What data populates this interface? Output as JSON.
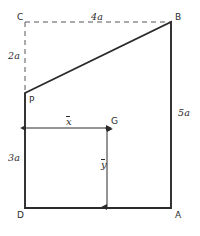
{
  "figure": {
    "stroke_color": "#2b2b2b",
    "background_color": "#ffffff",
    "vertices": [
      {
        "id": "C",
        "label": "C",
        "x": 25,
        "y": 22,
        "kind": "construction-corner"
      },
      {
        "id": "B",
        "label": "B",
        "x": 171,
        "y": 22,
        "kind": "shape-corner"
      },
      {
        "id": "P",
        "label": "P",
        "x": 25,
        "y": 93,
        "kind": "shape-corner"
      },
      {
        "id": "G",
        "label": "G",
        "x": 107,
        "y": 128,
        "kind": "centroid-point"
      },
      {
        "id": "D",
        "label": "D",
        "x": 25,
        "y": 208,
        "kind": "shape-corner"
      },
      {
        "id": "A",
        "label": "A",
        "x": 171,
        "y": 208,
        "kind": "shape-corner"
      }
    ],
    "dimensions": [
      {
        "id": "top",
        "label": "4a",
        "orientation": "horizontal",
        "style": "dashed",
        "between": "C-B"
      },
      {
        "id": "left-upper",
        "label": "2a",
        "orientation": "vertical",
        "style": "dashed",
        "between": "C-P"
      },
      {
        "id": "left-lower",
        "label": "3a",
        "orientation": "vertical",
        "style": "solid",
        "between": "P-D"
      },
      {
        "id": "right",
        "label": "5a",
        "orientation": "vertical",
        "style": "solid",
        "between": "B-A"
      }
    ],
    "centroid_dimensions": [
      {
        "id": "x-bar",
        "label": "x",
        "overbar": true,
        "orientation": "horizontal",
        "from": "D-edge",
        "to": "G"
      },
      {
        "id": "y-bar",
        "label": "y",
        "overbar": true,
        "orientation": "vertical",
        "from": "G",
        "to": "DA-edge"
      }
    ]
  }
}
